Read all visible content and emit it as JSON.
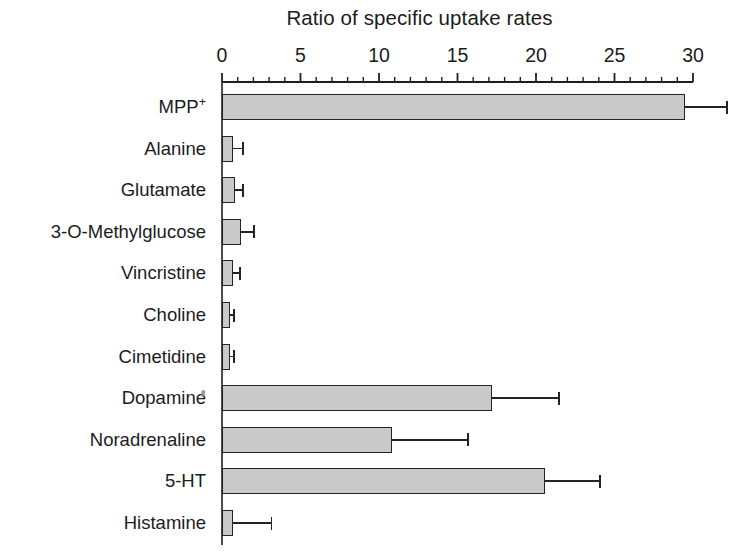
{
  "chart_data": {
    "type": "bar",
    "orientation": "horizontal",
    "title": "Ratio of specific uptake rates",
    "xlabel": "",
    "ylabel": "",
    "xlim": [
      0,
      30
    ],
    "xticks": [
      0,
      5,
      10,
      15,
      20,
      25,
      30
    ],
    "xtick_labels": [
      "0",
      "5",
      "10",
      "15",
      "20",
      "25",
      "30"
    ],
    "minor_tick_interval": 1,
    "grid": false,
    "legend": null,
    "bar_fill_color": "#c9c9c9",
    "bar_edge_color": "#242424",
    "error_bar_color": "#232323",
    "categories": [
      "MPP+",
      "Alanine",
      "Glutamate",
      "3-O-Methylglucose",
      "Vincristine",
      "Choline",
      "Cimetidine",
      "Dopamine",
      "Noradrenaline",
      "5-HT",
      "Histamine"
    ],
    "category_labels": [
      {
        "text": "MPP",
        "superscript": "+"
      },
      {
        "text": "Alanine",
        "superscript": ""
      },
      {
        "text": "Glutamate",
        "superscript": ""
      },
      {
        "text": "3-O-Methylglucose",
        "superscript": ""
      },
      {
        "text": "Vincristine",
        "superscript": ""
      },
      {
        "text": "Choline",
        "superscript": ""
      },
      {
        "text": "Cimetidine",
        "superscript": ""
      },
      {
        "text": "Dopamine",
        "superscript": ""
      },
      {
        "text": "Noradrenaline",
        "superscript": ""
      },
      {
        "text": "5-HT",
        "superscript": ""
      },
      {
        "text": "Histamine",
        "superscript": ""
      }
    ],
    "values": [
      29.5,
      0.7,
      0.8,
      1.2,
      0.7,
      0.5,
      0.5,
      17.2,
      10.8,
      20.6,
      0.7
    ],
    "errors": [
      2.6,
      0.6,
      0.5,
      0.8,
      0.4,
      0.2,
      0.2,
      4.2,
      4.8,
      3.4,
      2.4
    ],
    "series": [
      {
        "name": "Ratio of specific uptake rates",
        "values": [
          29.5,
          0.7,
          0.8,
          1.2,
          0.7,
          0.5,
          0.5,
          17.2,
          10.8,
          20.6,
          0.7
        ],
        "errors": [
          2.6,
          0.6,
          0.5,
          0.8,
          0.4,
          0.2,
          0.2,
          4.2,
          4.8,
          3.4,
          2.4
        ]
      }
    ]
  }
}
